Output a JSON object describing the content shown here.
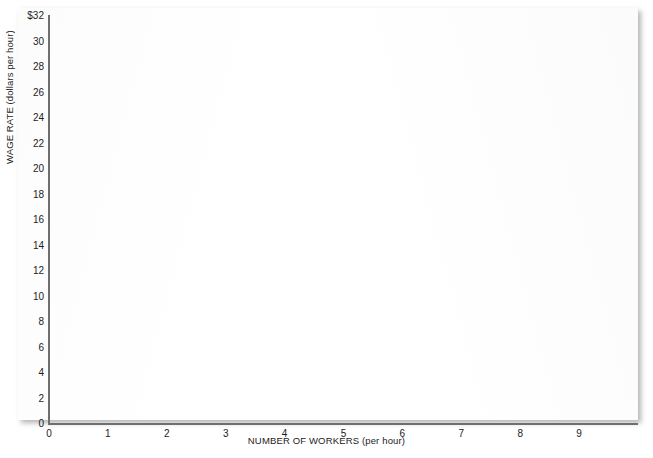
{
  "chart_data": {
    "type": "line",
    "title": "",
    "subtitle": "",
    "xlabel": "NUMBER OF WORKERS (per hour)",
    "ylabel": "WAGE RATE (dollars per hour)",
    "xlim": [
      0,
      10
    ],
    "ylim": [
      0,
      32
    ],
    "grid": false,
    "legend": null,
    "legend_position": "none",
    "annotations": [],
    "series": [],
    "x_ticks": [
      {
        "value": 0,
        "label": "0"
      },
      {
        "value": 1,
        "label": "1"
      },
      {
        "value": 2,
        "label": "2"
      },
      {
        "value": 3,
        "label": "3"
      },
      {
        "value": 4,
        "label": "4"
      },
      {
        "value": 5,
        "label": "5"
      },
      {
        "value": 6,
        "label": "6"
      },
      {
        "value": 7,
        "label": "7"
      },
      {
        "value": 8,
        "label": "8"
      },
      {
        "value": 9,
        "label": "9"
      }
    ],
    "y_ticks": [
      {
        "value": 32,
        "label": "$32"
      },
      {
        "value": 30,
        "label": "30"
      },
      {
        "value": 28,
        "label": "28"
      },
      {
        "value": 26,
        "label": "26"
      },
      {
        "value": 24,
        "label": "24"
      },
      {
        "value": 22,
        "label": "22"
      },
      {
        "value": 20,
        "label": "20"
      },
      {
        "value": 18,
        "label": "18"
      },
      {
        "value": 16,
        "label": "16"
      },
      {
        "value": 14,
        "label": "14"
      },
      {
        "value": 12,
        "label": "12"
      },
      {
        "value": 10,
        "label": "10"
      },
      {
        "value": 8,
        "label": "8"
      },
      {
        "value": 6,
        "label": "6"
      },
      {
        "value": 4,
        "label": "4"
      },
      {
        "value": 2,
        "label": "2"
      },
      {
        "value": 0,
        "label": "0"
      }
    ],
    "note": "Blank plotting grid - no data series are drawn in the plot area."
  },
  "artifact": {
    "top_text": ""
  },
  "colors": {
    "axis": "#6f6f6f",
    "text": "#1c1c1c",
    "panel": "#ffffff",
    "background": "#ffffff"
  }
}
